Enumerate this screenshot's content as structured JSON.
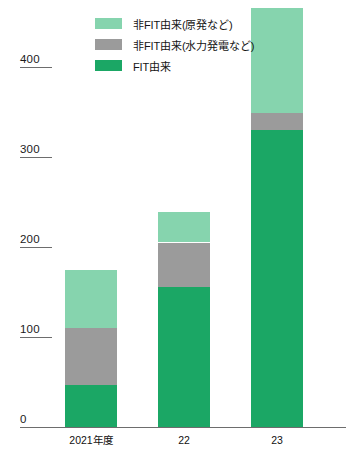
{
  "chart_data": {
    "type": "bar",
    "stacked": true,
    "title": "",
    "subtitle": "",
    "xlabel": "",
    "ylabel": "",
    "categories": [
      "2021年度",
      "22",
      "23"
    ],
    "series": [
      {
        "name": "FIT由来",
        "color": "#1ba765",
        "values": [
          47,
          156,
          330
        ]
      },
      {
        "name": "非FIT由来(水力発電など)",
        "color": "#9b9b9b",
        "values": [
          63,
          49,
          19
        ]
      },
      {
        "name": "非FIT由来(原発など)",
        "color": "#86d4ae",
        "values": [
          65,
          34,
          117
        ]
      }
    ],
    "totals": [
      175,
      239,
      466
    ],
    "ylim": [
      0,
      466
    ],
    "yticks": [
      0,
      100,
      200,
      300,
      400
    ],
    "ytick_labels": [
      "0",
      "100",
      "200",
      "300",
      "400"
    ],
    "grid": false,
    "tick_marks": true,
    "legend_position": "top-left-inside",
    "legend_order": [
      "非FIT由来(原発など)",
      "非FIT由来(水力発電など)",
      "FIT由来"
    ],
    "axis_color": "#6d6d6d",
    "background": "#ffffff"
  },
  "legend": {
    "items": [
      {
        "label": "非FIT由来(原発など)",
        "color": "#86d4ae",
        "name": "non-fit-nuclear"
      },
      {
        "label": "非FIT由来(水力発電など)",
        "color": "#9b9b9b",
        "name": "non-fit-hydro"
      },
      {
        "label": "FIT由来",
        "color": "#1ba765",
        "name": "fit"
      }
    ]
  },
  "axis": {
    "y_labels": [
      "400",
      "300",
      "200",
      "100",
      "0"
    ],
    "x_labels": [
      "2021年度",
      "22",
      "23"
    ]
  }
}
